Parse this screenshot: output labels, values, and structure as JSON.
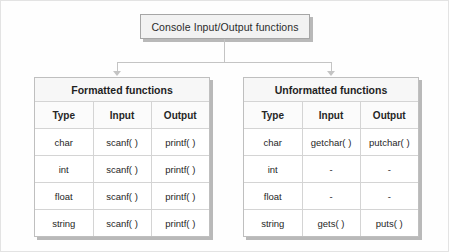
{
  "diagram": {
    "root": {
      "label": "Console Input/Output functions"
    },
    "branches": [
      {
        "title": "Formatted functions",
        "columns": [
          "Type",
          "Input",
          "Output"
        ],
        "rows": [
          [
            "char",
            "scanf( )",
            "printf( )"
          ],
          [
            "int",
            "scanf( )",
            "printf( )"
          ],
          [
            "float",
            "scanf( )",
            "printf( )"
          ],
          [
            "string",
            "scanf( )",
            "printf( )"
          ]
        ]
      },
      {
        "title": "Unformatted functions",
        "columns": [
          "Type",
          "Input",
          "Output"
        ],
        "rows": [
          [
            "char",
            "getchar( )",
            "putchar( )"
          ],
          [
            "int",
            "-",
            "-"
          ],
          [
            "float",
            "-",
            "-"
          ],
          [
            "string",
            "gets( )",
            "puts( )"
          ]
        ]
      }
    ]
  }
}
